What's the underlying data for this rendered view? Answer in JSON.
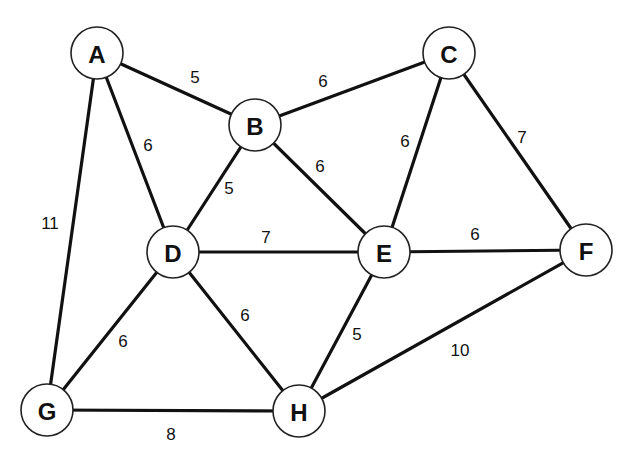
{
  "diagram": {
    "type": "weighted-undirected-graph",
    "nodes": [
      {
        "id": "A",
        "label": "A",
        "x": 97,
        "y": 53
      },
      {
        "id": "B",
        "label": "B",
        "x": 255,
        "y": 125
      },
      {
        "id": "C",
        "label": "C",
        "x": 449,
        "y": 53
      },
      {
        "id": "D",
        "label": "D",
        "x": 173,
        "y": 252
      },
      {
        "id": "E",
        "label": "E",
        "x": 384,
        "y": 252
      },
      {
        "id": "F",
        "label": "F",
        "x": 586,
        "y": 250
      },
      {
        "id": "G",
        "label": "G",
        "x": 47,
        "y": 410
      },
      {
        "id": "H",
        "label": "H",
        "x": 299,
        "y": 411
      }
    ],
    "edges": [
      {
        "from": "A",
        "to": "B",
        "weight": "5",
        "lx": 195,
        "ly": 77
      },
      {
        "from": "A",
        "to": "D",
        "weight": "6",
        "lx": 148,
        "ly": 145
      },
      {
        "from": "A",
        "to": "G",
        "weight": "11",
        "lx": 50,
        "ly": 223
      },
      {
        "from": "B",
        "to": "C",
        "weight": "6",
        "lx": 323,
        "ly": 81
      },
      {
        "from": "B",
        "to": "D",
        "weight": "5",
        "lx": 229,
        "ly": 188
      },
      {
        "from": "B",
        "to": "E",
        "weight": "6",
        "lx": 320,
        "ly": 166
      },
      {
        "from": "C",
        "to": "E",
        "weight": "6",
        "lx": 405,
        "ly": 141
      },
      {
        "from": "C",
        "to": "F",
        "weight": "7",
        "lx": 522,
        "ly": 137
      },
      {
        "from": "D",
        "to": "E",
        "weight": "7",
        "lx": 266,
        "ly": 237
      },
      {
        "from": "D",
        "to": "G",
        "weight": "6",
        "lx": 123,
        "ly": 341
      },
      {
        "from": "D",
        "to": "H",
        "weight": "6",
        "lx": 245,
        "ly": 315
      },
      {
        "from": "E",
        "to": "F",
        "weight": "6",
        "lx": 475,
        "ly": 234
      },
      {
        "from": "E",
        "to": "H",
        "weight": "5",
        "lx": 357,
        "ly": 334
      },
      {
        "from": "F",
        "to": "H",
        "weight": "10",
        "lx": 460,
        "ly": 350
      },
      {
        "from": "G",
        "to": "H",
        "weight": "8",
        "lx": 171,
        "ly": 434
      }
    ],
    "node_radius": 26,
    "colors": {
      "stroke": "#111111",
      "node_fill": "#ffffff",
      "background": "#ffffff"
    }
  }
}
